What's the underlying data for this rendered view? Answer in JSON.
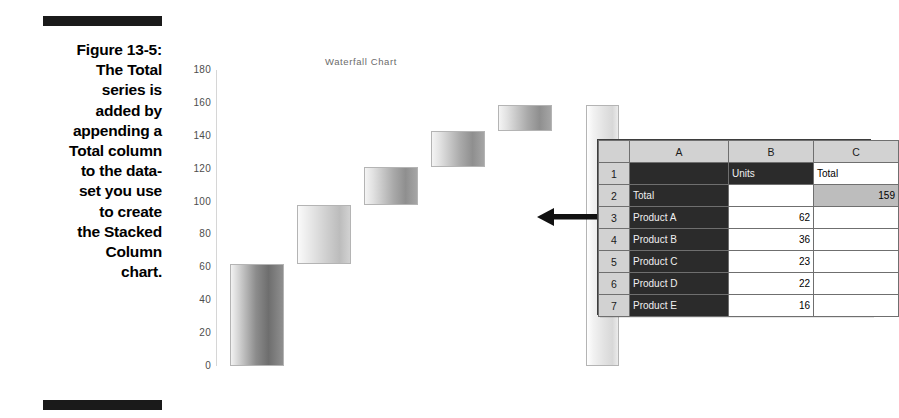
{
  "figure": {
    "number_label": "Figure 13-5:",
    "caption_lines": [
      "The Total",
      "series is",
      "added by",
      "appending a",
      "Total column",
      "to the data-",
      "set you use",
      "to create",
      "the Stacked",
      "Column",
      "chart."
    ]
  },
  "chart_data": {
    "type": "bar",
    "title": "Waterfall Chart",
    "xlabel": "",
    "ylabel": "",
    "ylim": [
      0,
      180
    ],
    "ytick_labels": [
      "180",
      "160",
      "140",
      "120",
      "100",
      "80",
      "60",
      "40",
      "20",
      "0"
    ],
    "yticks": [
      180,
      160,
      140,
      120,
      100,
      80,
      60,
      40,
      20,
      0
    ],
    "grid": false,
    "legend": "none",
    "categories": [
      "Product A",
      "Product B",
      "Product C",
      "Product D",
      "Product E",
      "Total"
    ],
    "values": [
      62,
      36,
      23,
      22,
      16,
      159
    ],
    "bar_bases": [
      0,
      62,
      98,
      121,
      143,
      0
    ],
    "bar_tops": [
      62,
      98,
      121,
      143,
      159,
      159
    ],
    "note": "Waterfall built from stacked column: invisible base series plus visible Units series; final Total column spans 0 to 159"
  },
  "annotation": {
    "arrow_icon": "arrow-left-icon",
    "arrow_direction": "left"
  },
  "spreadsheet": {
    "column_headers": [
      "A",
      "B",
      "C"
    ],
    "row_headers": [
      "1",
      "2",
      "3",
      "4",
      "5",
      "6",
      "7"
    ],
    "rows": [
      {
        "num": "1",
        "a": "",
        "b": "Units",
        "c": "Total"
      },
      {
        "num": "2",
        "a": "Total",
        "b": "",
        "c": "159"
      },
      {
        "num": "3",
        "a": "Product A",
        "b": "62",
        "c": ""
      },
      {
        "num": "4",
        "a": "Product B",
        "b": "36",
        "c": ""
      },
      {
        "num": "5",
        "a": "Product C",
        "b": "23",
        "c": ""
      },
      {
        "num": "6",
        "a": "Product D",
        "b": "22",
        "c": ""
      },
      {
        "num": "7",
        "a": "Product E",
        "b": "16",
        "c": ""
      }
    ]
  },
  "colors": {
    "rule": "#1a1a1a",
    "sheet_header": "#d2d2d2",
    "sheet_dark_cell": "#2b2b2b",
    "sheet_highlight_cell": "#bdbdbd",
    "chart_title": "#6b6b6b",
    "axis_label": "#4d4d4d"
  }
}
